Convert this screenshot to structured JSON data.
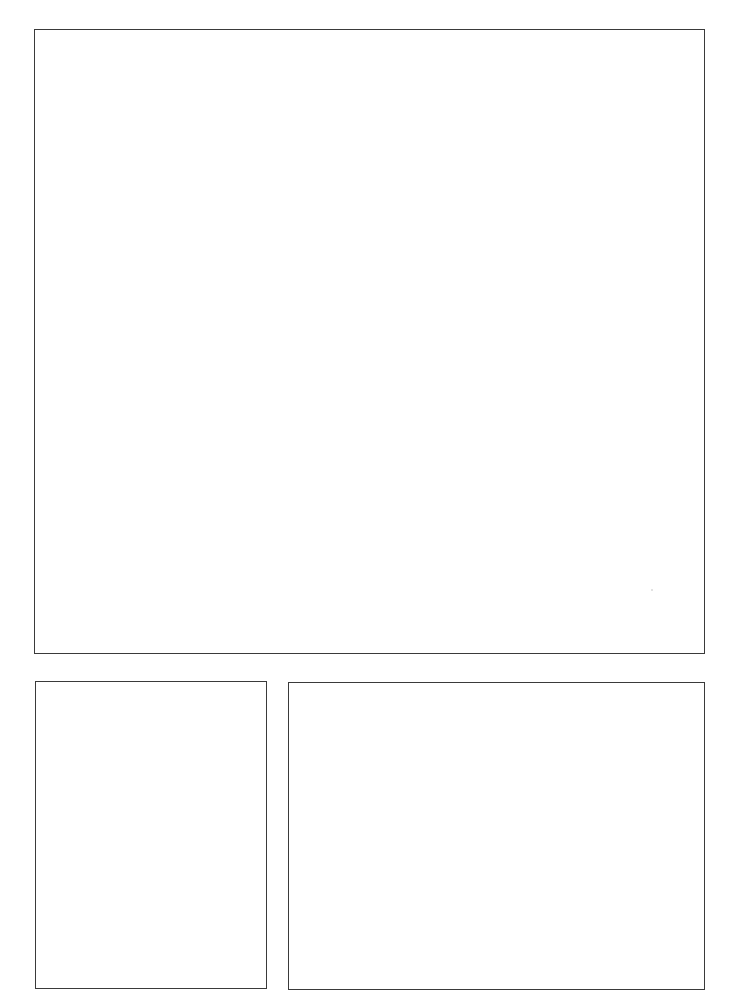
{
  "page": {
    "type": "blank-panel-layout",
    "background": "#ffffff",
    "border_color": "#3a3a3a",
    "panels": [
      {
        "id": "top",
        "label": "",
        "bbox": {
          "x": 34,
          "y": 29,
          "w": 671,
          "h": 625
        },
        "content": ""
      },
      {
        "id": "bottom-left",
        "label": "",
        "bbox": {
          "x": 35,
          "y": 681,
          "w": 232,
          "h": 308
        },
        "content": ""
      },
      {
        "id": "bottom-right",
        "label": "",
        "bbox": {
          "x": 288,
          "y": 682,
          "w": 417,
          "h": 308
        },
        "content": ""
      }
    ]
  }
}
